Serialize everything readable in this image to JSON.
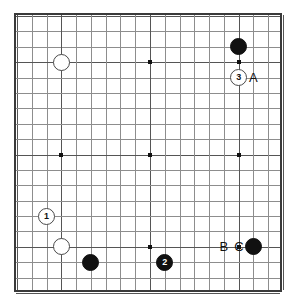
{
  "diagram": {
    "type": "go-board-diagram",
    "board_size": 19,
    "geometry": {
      "origin_x": 15,
      "origin_y": 14,
      "step_x": 14.78,
      "step_y": 15.39,
      "stone_diameter": 17
    },
    "colors": {
      "background": "#ffffff",
      "border": "#3a3a3a",
      "grid_minor": "#8d8d8d",
      "grid_major": "#555555",
      "black_stone": "#111111",
      "white_stone": "#ffffff",
      "white_stone_edge": "#4a4a4a",
      "label_text": "#111111"
    },
    "star_points": [
      {
        "col": 3,
        "row": 3
      },
      {
        "col": 9,
        "row": 3
      },
      {
        "col": 15,
        "row": 3
      },
      {
        "col": 3,
        "row": 9
      },
      {
        "col": 9,
        "row": 9
      },
      {
        "col": 15,
        "row": 9
      },
      {
        "col": 3,
        "row": 15
      },
      {
        "col": 9,
        "row": 15
      },
      {
        "col": 15,
        "row": 15
      }
    ],
    "stones": [
      {
        "id": "white-hoshi-upper-left",
        "color": "white",
        "col": 3,
        "row": 3,
        "marker": ""
      },
      {
        "id": "black-upper-right",
        "color": "black",
        "col": 15,
        "row": 2,
        "marker": ""
      },
      {
        "id": "white-move-3",
        "color": "white",
        "col": 15,
        "row": 4,
        "marker": "3"
      },
      {
        "id": "white-move-1",
        "color": "white",
        "col": 2,
        "row": 13,
        "marker": "1"
      },
      {
        "id": "white-lower-left",
        "color": "white",
        "col": 3,
        "row": 15,
        "marker": ""
      },
      {
        "id": "black-lower-left",
        "color": "black",
        "col": 5,
        "row": 16,
        "marker": ""
      },
      {
        "id": "black-move-2",
        "color": "black",
        "col": 10,
        "row": 16,
        "marker": "2"
      },
      {
        "id": "black-lower-right",
        "color": "black",
        "col": 16,
        "row": 15,
        "marker": ""
      }
    ],
    "point_labels": [
      {
        "id": "label-A",
        "text": "A",
        "col": 16,
        "row": 4
      },
      {
        "id": "label-B",
        "text": "B",
        "col": 14,
        "row": 15
      },
      {
        "id": "label-C",
        "text": "C",
        "col": 15,
        "row": 15
      }
    ]
  }
}
